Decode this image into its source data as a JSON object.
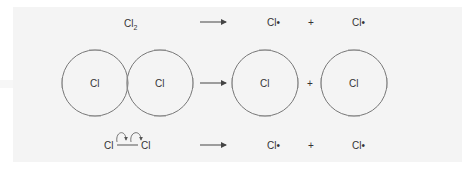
{
  "rows": [
    {
      "reactant": {
        "symbol": "Cl",
        "subscript": "2"
      },
      "arrow": "→",
      "products": [
        "Cl•",
        "Cl•"
      ],
      "plus": "+"
    },
    {
      "reactant_atoms": [
        "Cl",
        "Cl"
      ],
      "arrow": "→",
      "product_atoms": [
        "Cl",
        "Cl"
      ],
      "plus": "+"
    },
    {
      "reactant": {
        "left": "Cl",
        "right": "Cl",
        "bond": "single-bond",
        "electron_arrows": 2
      },
      "arrow": "→",
      "products": [
        "Cl•",
        "Cl•"
      ],
      "plus": "+"
    }
  ],
  "colors": {
    "line": "#666666",
    "text": "#333333",
    "background": "#f4f4f4"
  }
}
